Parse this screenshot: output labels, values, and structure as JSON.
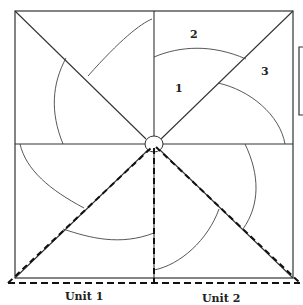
{
  "diagram": {
    "type": "pinwheel-square-layout",
    "region_labels": [
      "1",
      "2",
      "3"
    ],
    "unit_labels": [
      "Unit 1",
      "Unit 2"
    ],
    "colors": {
      "stroke": "#333333",
      "dashed": "#111111",
      "background": "#ffffff"
    }
  }
}
